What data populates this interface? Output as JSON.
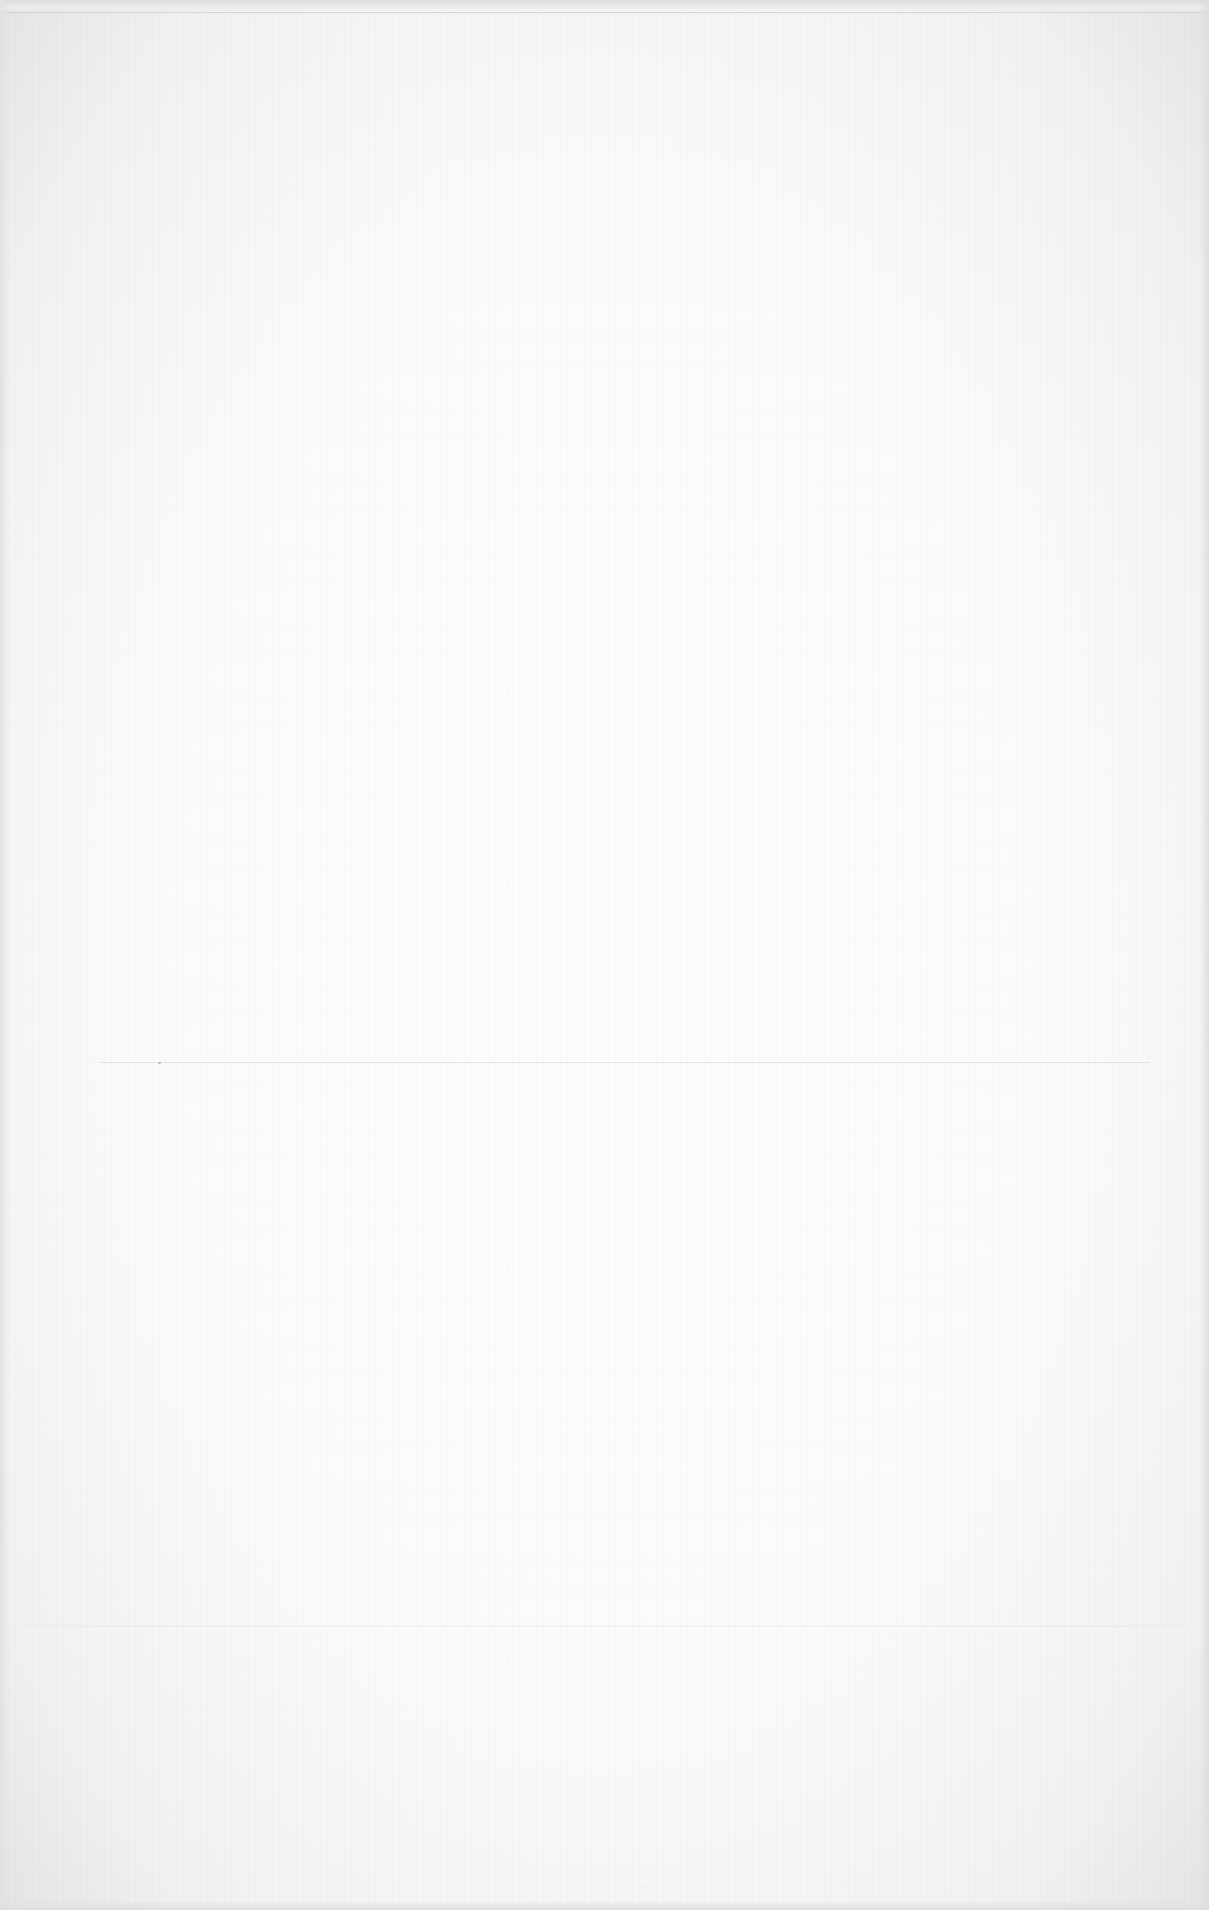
{
  "document": {
    "type": "blank-scanned-page",
    "text": "",
    "colors": {
      "paper": "#fbfbfb",
      "edge": "#e0e0e0",
      "fold_line": "#e3e3e3"
    }
  }
}
